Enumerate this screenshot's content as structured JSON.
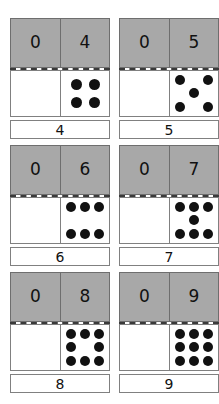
{
  "worksheet": {
    "colors": {
      "header_fill": "#a8a8a8",
      "header_border": "#6e6e6e",
      "pane_border": "#808080",
      "pip": "#111111",
      "divider": "#3a3a3a",
      "page_background": "#ffffff"
    },
    "cards": [
      {
        "left_addend": "0",
        "right_addend": "4",
        "total": "4",
        "left_pips": 0,
        "right_pips": 4,
        "right_pattern": "quad",
        "right_cells": [
          true,
          true,
          true,
          true
        ]
      },
      {
        "left_addend": "0",
        "right_addend": "5",
        "total": "5",
        "left_pips": 0,
        "right_pips": 5,
        "right_pattern": "grid",
        "right_cells": [
          true,
          false,
          true,
          false,
          true,
          false,
          true,
          false,
          true
        ]
      },
      {
        "left_addend": "0",
        "right_addend": "6",
        "total": "6",
        "left_pips": 0,
        "right_pips": 6,
        "right_pattern": "grid",
        "right_cells": [
          true,
          true,
          true,
          false,
          false,
          false,
          true,
          true,
          true
        ]
      },
      {
        "left_addend": "0",
        "right_addend": "7",
        "total": "7",
        "left_pips": 0,
        "right_pips": 7,
        "right_pattern": "grid",
        "right_cells": [
          true,
          true,
          true,
          false,
          true,
          false,
          true,
          true,
          true
        ]
      },
      {
        "left_addend": "0",
        "right_addend": "8",
        "total": "8",
        "left_pips": 0,
        "right_pips": 8,
        "right_pattern": "grid",
        "right_cells": [
          true,
          true,
          true,
          true,
          false,
          true,
          true,
          true,
          true
        ]
      },
      {
        "left_addend": "0",
        "right_addend": "9",
        "total": "9",
        "left_pips": 0,
        "right_pips": 9,
        "right_pattern": "grid",
        "right_cells": [
          true,
          true,
          true,
          true,
          true,
          true,
          true,
          true,
          true
        ]
      }
    ]
  }
}
